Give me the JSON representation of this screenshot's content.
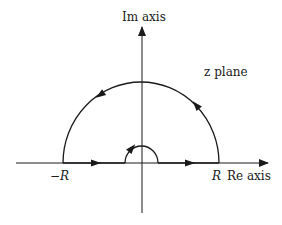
{
  "diagram": {
    "type": "contour-integration",
    "labels": {
      "im_axis": "Im axis",
      "re_axis": "Re axis",
      "plane": "z plane",
      "neg_r": "−R",
      "pos_r": "R"
    },
    "colors": {
      "stroke": "#1a1a1a",
      "background": "#ffffff"
    },
    "contour": {
      "large_semicircle_radius": "R",
      "direction": "counterclockwise",
      "small_semicircle": "indentation around origin"
    }
  }
}
